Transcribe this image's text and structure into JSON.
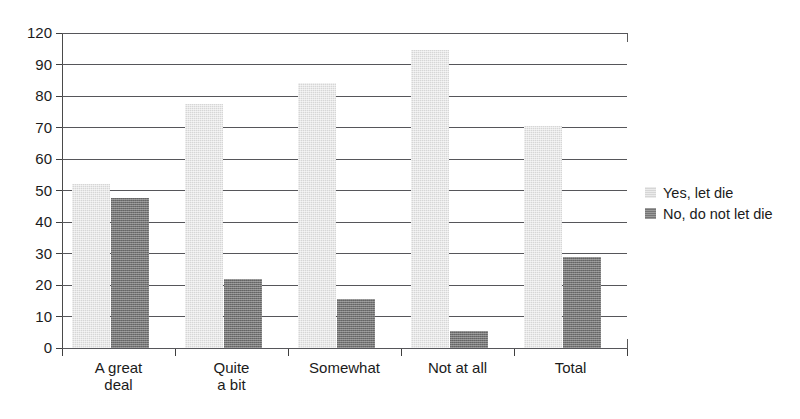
{
  "chart_data": {
    "type": "bar",
    "title": "",
    "subtitle": "",
    "xlabel": "",
    "ylabel": "",
    "categories": [
      "A great\ndeal",
      "Quite\na bit",
      "Somewhat",
      "Not at all",
      "Total"
    ],
    "category_labels_flat": [
      "A great deal",
      "Quite a bit",
      "Somewhat",
      "Not at all",
      "Total"
    ],
    "series": [
      {
        "name": "Yes, let die",
        "color": "#d6d6d6",
        "values": [
          52,
          77.5,
          84,
          104,
          70.5
        ]
      },
      {
        "name": "No, do not let die",
        "color": "#757575",
        "values": [
          47.5,
          22,
          15.5,
          5.5,
          29
        ]
      }
    ],
    "ytick_labels": [
      "0",
      "10",
      "20",
      "30",
      "40",
      "50",
      "60",
      "70",
      "80",
      "90",
      "120"
    ],
    "ytick_values": [
      0,
      10,
      20,
      30,
      40,
      50,
      60,
      70,
      80,
      90,
      120
    ],
    "ylim": [
      0,
      120
    ],
    "grid": true,
    "grid_orientation": "horizontal",
    "legend_position": "right",
    "axis_note": "y-axis tick labels are unevenly spaced in value (90 then 120) but evenly spaced on the drawn axis"
  },
  "legend": {
    "entries": [
      {
        "label": "Yes, let die",
        "color": "#d6d6d6"
      },
      {
        "label": "No, do not let die",
        "color": "#757575"
      }
    ]
  },
  "colors": {
    "series_light": "#d6d6d6",
    "series_dark": "#757575",
    "gridline": "#56565a",
    "axis": "#4a4a4a",
    "text": "#1b1b1b",
    "background": "#ffffff"
  }
}
